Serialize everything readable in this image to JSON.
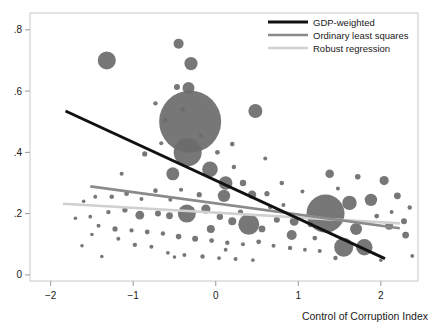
{
  "chart_data": {
    "type": "scatter",
    "title": "",
    "subtitle": "",
    "xlabel": "Control of Corruption Index",
    "ylabel": "",
    "xlim": [
      -2.25,
      2.45
    ],
    "ylim": [
      -0.02,
      0.855
    ],
    "grid": false,
    "xticks": [
      -2,
      -1,
      0,
      1,
      2
    ],
    "xtick_labels": [
      "−2",
      "−1",
      "0",
      "1",
      "2"
    ],
    "yticks": [
      0,
      0.2,
      0.4,
      0.6,
      0.8
    ],
    "ytick_labels": [
      "0",
      ".2",
      ".4",
      ".6",
      ".8"
    ],
    "marker_color": "#6b6b6b",
    "marker_note": "bubble area proportional to weight (e.g. GDP / population)",
    "legend": {
      "position": "top-right",
      "entries": [
        {
          "label": "GDP-weighted",
          "color": "#111111",
          "width": 3.0
        },
        {
          "label": "Ordinary least squares",
          "color": "#8a8a8a",
          "width": 2.6
        },
        {
          "label": "Robust regression",
          "color": "#d0d0d0",
          "width": 2.6
        }
      ]
    },
    "lines": [
      {
        "name": "GDP-weighted",
        "color": "#111111",
        "width": 3.0,
        "x": [
          -1.82,
          2.05
        ],
        "y": [
          0.535,
          0.053
        ]
      },
      {
        "name": "Ordinary least squares",
        "color": "#8a8a8a",
        "width": 2.6,
        "x": [
          -1.52,
          2.23
        ],
        "y": [
          0.289,
          0.152
        ]
      },
      {
        "name": "Robust regression",
        "color": "#d0d0d0",
        "width": 2.6,
        "x": [
          -1.85,
          2.23
        ],
        "y": [
          0.232,
          0.168
        ]
      }
    ],
    "points": [
      {
        "x": -1.32,
        "y": 0.7,
        "r": 9.0
      },
      {
        "x": -0.45,
        "y": 0.755,
        "r": 5.0
      },
      {
        "x": -0.3,
        "y": 0.69,
        "r": 6.6
      },
      {
        "x": -0.33,
        "y": 0.61,
        "r": 6.0
      },
      {
        "x": -0.73,
        "y": 0.56,
        "r": 2.2
      },
      {
        "x": -0.47,
        "y": 0.613,
        "r": 3.0
      },
      {
        "x": -0.61,
        "y": 0.505,
        "r": 2.4
      },
      {
        "x": -0.4,
        "y": 0.54,
        "r": 2.4
      },
      {
        "x": -0.31,
        "y": 0.5,
        "r": 31.0
      },
      {
        "x": -0.34,
        "y": 0.4,
        "r": 14.0
      },
      {
        "x": 0.48,
        "y": 0.535,
        "r": 7.0
      },
      {
        "x": 0.2,
        "y": 0.427,
        "r": 2.3
      },
      {
        "x": -0.07,
        "y": 0.345,
        "r": 7.8
      },
      {
        "x": -0.52,
        "y": 0.33,
        "r": 6.5
      },
      {
        "x": -0.86,
        "y": 0.395,
        "r": 2.6
      },
      {
        "x": -1.14,
        "y": 0.33,
        "r": 2.0
      },
      {
        "x": -0.73,
        "y": 0.275,
        "r": 2.3
      },
      {
        "x": -0.55,
        "y": 0.245,
        "r": 2.0
      },
      {
        "x": -0.42,
        "y": 0.278,
        "r": 2.1
      },
      {
        "x": 0.12,
        "y": 0.3,
        "r": 6.8
      },
      {
        "x": 0.1,
        "y": 0.258,
        "r": 6.2
      },
      {
        "x": 0.33,
        "y": 0.3,
        "r": 3.2
      },
      {
        "x": 0.44,
        "y": 0.262,
        "r": 4.2
      },
      {
        "x": 0.62,
        "y": 0.265,
        "r": 2.6
      },
      {
        "x": 0.8,
        "y": 0.3,
        "r": 2.3
      },
      {
        "x": 1.05,
        "y": 0.272,
        "r": 2.0
      },
      {
        "x": 1.38,
        "y": 0.33,
        "r": 4.3
      },
      {
        "x": 1.72,
        "y": 0.32,
        "r": 2.8
      },
      {
        "x": 2.04,
        "y": 0.308,
        "r": 4.6
      },
      {
        "x": 2.2,
        "y": 0.258,
        "r": 3.4
      },
      {
        "x": 1.88,
        "y": 0.245,
        "r": 6.2
      },
      {
        "x": 1.33,
        "y": 0.2,
        "r": 19.0
      },
      {
        "x": 1.62,
        "y": 0.235,
        "r": 7.2
      },
      {
        "x": 1.7,
        "y": 0.15,
        "r": 6.0
      },
      {
        "x": 1.55,
        "y": 0.09,
        "r": 9.5
      },
      {
        "x": 1.8,
        "y": 0.09,
        "r": 8.2
      },
      {
        "x": 2.1,
        "y": 0.16,
        "r": 4.0
      },
      {
        "x": 2.28,
        "y": 0.175,
        "r": 3.0
      },
      {
        "x": 2.3,
        "y": 0.13,
        "r": 3.4
      },
      {
        "x": 2.13,
        "y": 0.205,
        "r": 2.0
      },
      {
        "x": 2.35,
        "y": 0.22,
        "r": 2.2
      },
      {
        "x": 1.15,
        "y": 0.165,
        "r": 3.0
      },
      {
        "x": 0.95,
        "y": 0.175,
        "r": 4.4
      },
      {
        "x": 0.92,
        "y": 0.13,
        "r": 5.0
      },
      {
        "x": 0.74,
        "y": 0.18,
        "r": 3.0
      },
      {
        "x": 0.56,
        "y": 0.15,
        "r": 3.4
      },
      {
        "x": 0.4,
        "y": 0.165,
        "r": 10.5
      },
      {
        "x": 0.2,
        "y": 0.175,
        "r": 4.0
      },
      {
        "x": 0.05,
        "y": 0.19,
        "r": 3.2
      },
      {
        "x": -0.12,
        "y": 0.215,
        "r": 4.6
      },
      {
        "x": -0.35,
        "y": 0.2,
        "r": 9.0
      },
      {
        "x": -0.56,
        "y": 0.193,
        "r": 3.4
      },
      {
        "x": -0.7,
        "y": 0.2,
        "r": 3.0
      },
      {
        "x": -0.92,
        "y": 0.195,
        "r": 4.4
      },
      {
        "x": -1.1,
        "y": 0.212,
        "r": 2.6
      },
      {
        "x": -1.3,
        "y": 0.205,
        "r": 2.2
      },
      {
        "x": -1.52,
        "y": 0.19,
        "r": 1.9
      },
      {
        "x": -1.7,
        "y": 0.185,
        "r": 1.8
      },
      {
        "x": -1.42,
        "y": 0.16,
        "r": 2.0
      },
      {
        "x": -1.22,
        "y": 0.15,
        "r": 2.6
      },
      {
        "x": -1.02,
        "y": 0.145,
        "r": 2.1
      },
      {
        "x": -0.83,
        "y": 0.14,
        "r": 2.4
      },
      {
        "x": -0.64,
        "y": 0.135,
        "r": 2.2
      },
      {
        "x": -0.45,
        "y": 0.125,
        "r": 2.8
      },
      {
        "x": -0.25,
        "y": 0.118,
        "r": 3.0
      },
      {
        "x": -0.05,
        "y": 0.112,
        "r": 2.4
      },
      {
        "x": 0.14,
        "y": 0.105,
        "r": 2.2
      },
      {
        "x": 0.33,
        "y": 0.1,
        "r": 2.0
      },
      {
        "x": 0.52,
        "y": 0.108,
        "r": 2.4
      },
      {
        "x": 0.7,
        "y": 0.095,
        "r": 2.0
      },
      {
        "x": 0.9,
        "y": 0.088,
        "r": 2.2
      },
      {
        "x": 1.08,
        "y": 0.082,
        "r": 1.9
      },
      {
        "x": 1.26,
        "y": 0.078,
        "r": 2.0
      },
      {
        "x": -1.6,
        "y": 0.24,
        "r": 1.8
      },
      {
        "x": -1.46,
        "y": 0.255,
        "r": 2.0
      },
      {
        "x": -1.26,
        "y": 0.255,
        "r": 2.3
      },
      {
        "x": -1.08,
        "y": 0.265,
        "r": 2.4
      },
      {
        "x": -0.9,
        "y": 0.248,
        "r": 2.0
      },
      {
        "x": -1.18,
        "y": 0.118,
        "r": 2.0
      },
      {
        "x": -0.98,
        "y": 0.098,
        "r": 2.2
      },
      {
        "x": -0.78,
        "y": 0.092,
        "r": 2.0
      },
      {
        "x": -0.58,
        "y": 0.072,
        "r": 1.9
      },
      {
        "x": -0.38,
        "y": 0.065,
        "r": 2.0
      },
      {
        "x": -0.16,
        "y": 0.06,
        "r": 2.2
      },
      {
        "x": 0.04,
        "y": 0.055,
        "r": 1.9
      },
      {
        "x": 0.24,
        "y": 0.052,
        "r": 2.0
      },
      {
        "x": 0.45,
        "y": 0.048,
        "r": 1.8
      },
      {
        "x": -1.38,
        "y": 0.06,
        "r": 1.8
      },
      {
        "x": -1.62,
        "y": 0.095,
        "r": 1.8
      },
      {
        "x": -0.66,
        "y": 0.43,
        "r": 2.0
      },
      {
        "x": -0.18,
        "y": 0.455,
        "r": 2.0
      },
      {
        "x": 0.02,
        "y": 0.4,
        "r": 2.4
      },
      {
        "x": 0.6,
        "y": 0.38,
        "r": 2.0
      },
      {
        "x": 0.22,
        "y": 0.352,
        "r": 2.2
      },
      {
        "x": -0.2,
        "y": 0.262,
        "r": 2.6
      },
      {
        "x": 0.66,
        "y": 0.222,
        "r": 2.2
      },
      {
        "x": 1.48,
        "y": 0.282,
        "r": 2.0
      },
      {
        "x": 1.95,
        "y": 0.192,
        "r": 2.4
      },
      {
        "x": 2.38,
        "y": 0.062,
        "r": 1.9
      },
      {
        "x": 0.82,
        "y": 0.228,
        "r": 2.0
      },
      {
        "x": -0.06,
        "y": 0.15,
        "r": 4.0
      },
      {
        "x": 0.3,
        "y": 0.205,
        "r": 2.6
      },
      {
        "x": -1.5,
        "y": 0.132,
        "r": 1.8
      },
      {
        "x": 1.2,
        "y": 0.12,
        "r": 2.4
      },
      {
        "x": 1.45,
        "y": 0.055,
        "r": 2.2
      },
      {
        "x": 2.0,
        "y": 0.048,
        "r": 1.8
      },
      {
        "x": -0.5,
        "y": 0.058,
        "r": 1.8
      },
      {
        "x": 0.12,
        "y": 0.082,
        "r": 1.9
      }
    ]
  }
}
